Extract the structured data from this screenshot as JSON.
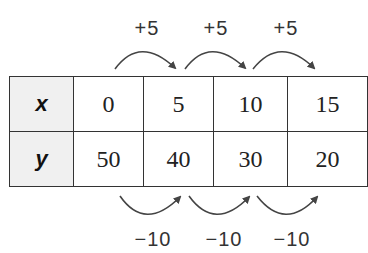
{
  "table": {
    "rows": [
      {
        "header": "x",
        "values": [
          "0",
          "5",
          "10",
          "15"
        ]
      },
      {
        "header": "y",
        "values": [
          "50",
          "40",
          "30",
          "20"
        ]
      }
    ]
  },
  "top_labels": [
    "+5",
    "+5",
    "+5"
  ],
  "bottom_labels": [
    "−10",
    "−10",
    "−10"
  ],
  "colors": {
    "line": "#333333",
    "header_bg": "#f0f0f0",
    "arrow": "#444444"
  }
}
